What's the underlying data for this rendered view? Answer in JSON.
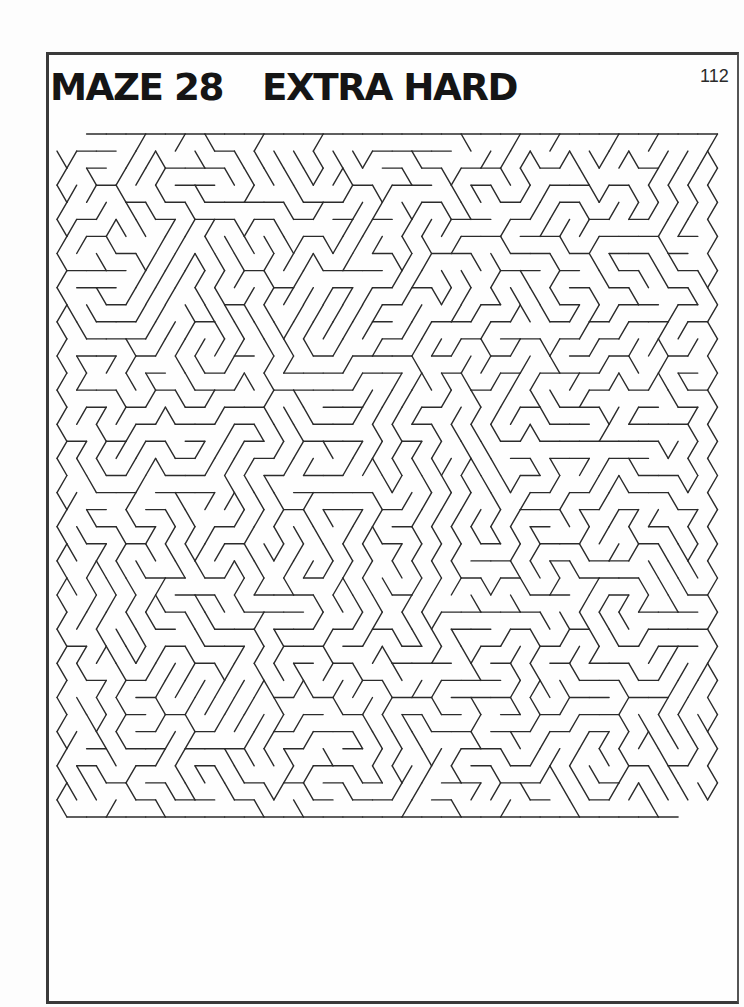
{
  "page": {
    "title_number": "MAZE 28",
    "title_difficulty": "EXTRA HARD",
    "page_number": "112"
  },
  "maze": {
    "shape": "triangular-grid",
    "difficulty": "EXTRA HARD",
    "colors": {
      "walls": "#2b2b2b",
      "frame": "#3a3a3a",
      "background": "#fefefe"
    }
  }
}
